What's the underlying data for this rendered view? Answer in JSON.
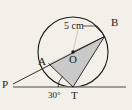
{
  "figure": {
    "background_color": "#f3f0ea",
    "stroke_color": "#1a1a1a",
    "shade_color": "#c9c9c9"
  },
  "labels": {
    "radius_dimension": "5 cm",
    "point_b": "B",
    "point_o": "O",
    "point_a": "A",
    "point_p": "P",
    "point_t": "T",
    "angle_at_t": "30°"
  },
  "geometry": {
    "circle": {
      "cx": 73,
      "cy": 52,
      "r": 35
    },
    "points": {
      "B": {
        "x": 104.5,
        "y": 36.5
      },
      "O": {
        "x": 73,
        "y": 52
      },
      "A": {
        "x": 48.5,
        "y": 63.5
      },
      "T": {
        "x": 73,
        "y": 87
      },
      "P": {
        "x": 13,
        "y": 84
      }
    },
    "segments": [
      {
        "name": "radius-OB",
        "from": "O",
        "to": "B"
      },
      {
        "name": "chord-AB",
        "from": "A",
        "to": "B"
      },
      {
        "name": "chord-AT",
        "from": "A",
        "to": "T"
      },
      {
        "name": "chord-BT",
        "from": "B",
        "to": "T"
      },
      {
        "name": "secant-PA",
        "from": "P",
        "to": "A"
      },
      {
        "name": "tangent-line",
        "from": "P",
        "to": "right-edge"
      }
    ],
    "shaded_region": "triangle-ABT",
    "tangent_point": "T",
    "angle_value_degrees": 30
  }
}
